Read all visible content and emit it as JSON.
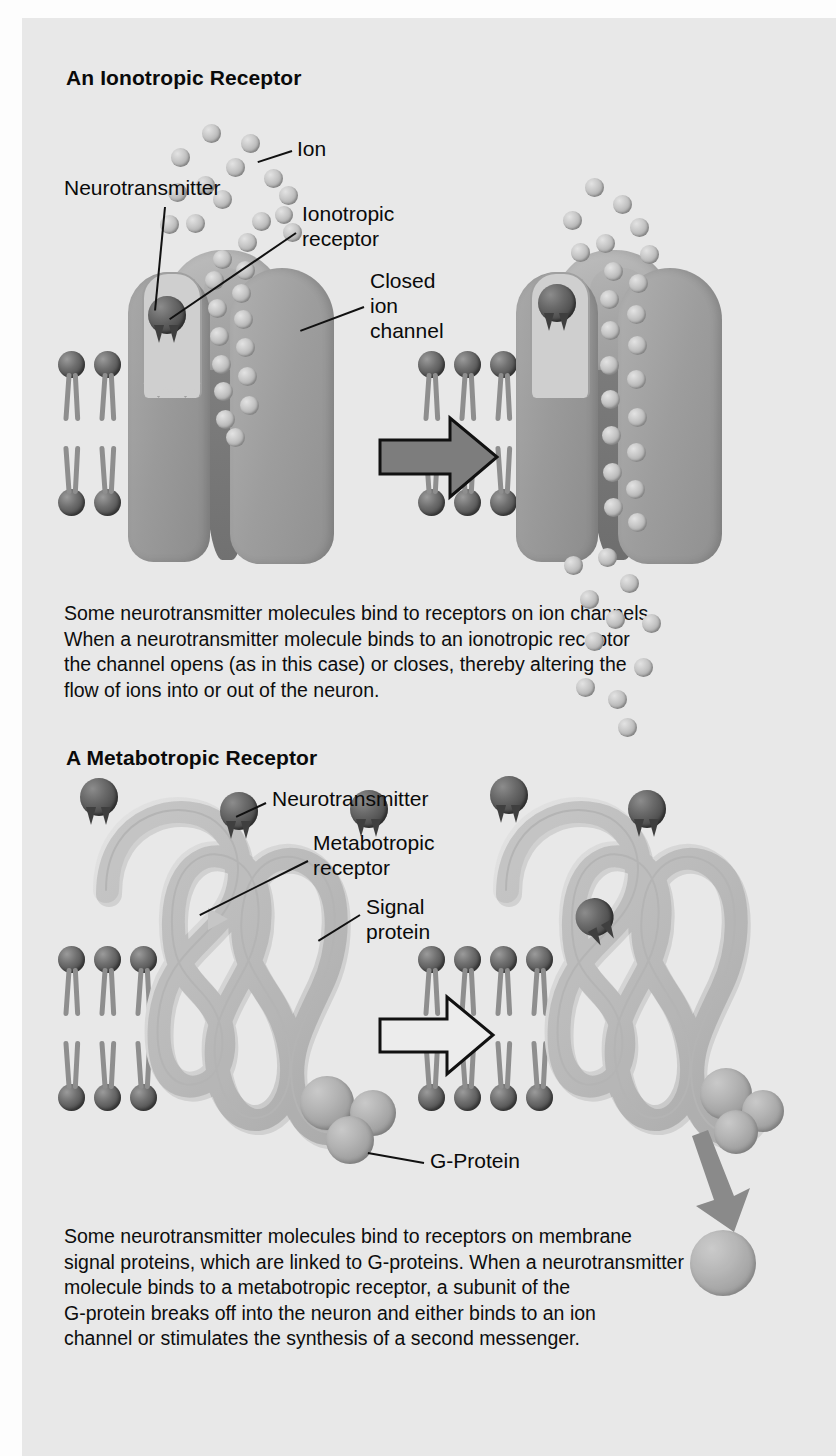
{
  "figure": {
    "background_color": "#e8e8e8",
    "page_width": 836,
    "page_height": 1456
  },
  "panels": [
    {
      "id": "ionotropic",
      "title": "An Ionotropic Receptor",
      "caption": "Some neurotransmitter molecules bind to receptors on ion channels.\nWhen a neurotransmitter molecule binds to an ionotropic receptor\nthe channel opens (as in this case) or closes, thereby altering the\nflow of ions into or out of the neuron.",
      "labels": [
        {
          "id": "ion",
          "text": "Ion"
        },
        {
          "id": "neurotransmitter",
          "text": "Neurotransmitter"
        },
        {
          "id": "ionotropic-receptor",
          "text": "Ionotropic\nreceptor"
        },
        {
          "id": "closed-ion-channel",
          "text": "Closed\nion\nchannel"
        }
      ],
      "states": [
        {
          "id": "left",
          "name": "closed-channel"
        },
        {
          "id": "right",
          "name": "open-channel"
        }
      ]
    },
    {
      "id": "metabotropic",
      "title": "A Metabotropic Receptor",
      "caption": "Some neurotransmitter molecules bind to receptors on membrane\nsignal proteins, which are linked to G-proteins. When a neurotransmitter\nmolecule binds to a metabotropic receptor, a subunit of the\nG-protein breaks off into the neuron and either binds to an ion\nchannel or stimulates the synthesis of a second messenger.",
      "labels": [
        {
          "id": "neurotransmitter",
          "text": "Neurotransmitter"
        },
        {
          "id": "metabotropic-receptor",
          "text": "Metabotropic\nreceptor"
        },
        {
          "id": "signal-protein",
          "text": "Signal\nprotein"
        },
        {
          "id": "g-protein",
          "text": "G-Protein"
        }
      ],
      "states": [
        {
          "id": "left",
          "name": "unbound-receptor"
        },
        {
          "id": "right",
          "name": "bound-receptor-g-subunit-released"
        }
      ]
    }
  ],
  "colors": {
    "background": "#e8e8e8",
    "text": "#0a0a0a",
    "lipid_head": "#5a5a5a",
    "lipid_tail": "#8e8e8e",
    "protein": "#9c9c9c",
    "ion": "#c2c2c2",
    "neurotransmitter": "#4c4c4c",
    "g_protein": "#b0b0b0",
    "arrow": "#7d7d7d"
  }
}
